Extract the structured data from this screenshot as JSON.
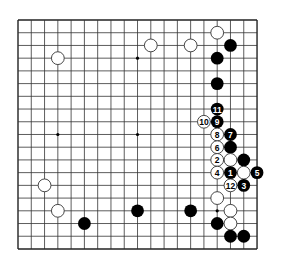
{
  "board": {
    "size": 19,
    "origin_x": 18,
    "origin_y": 20,
    "cell_w": 13.28,
    "cell_h": 12.72,
    "stone_radius": 6.4,
    "line_color": "#333333",
    "edge_color": "#222222",
    "black_color": "#000000",
    "white_fill": "#ffffff",
    "white_stroke": "#333333",
    "star_points": [
      [
        3,
        3
      ],
      [
        9,
        3
      ],
      [
        15,
        3
      ],
      [
        3,
        9
      ],
      [
        9,
        9
      ],
      [
        15,
        9
      ],
      [
        3,
        15
      ],
      [
        9,
        15
      ],
      [
        15,
        15
      ]
    ]
  },
  "stones": [
    {
      "color": "white",
      "col": 15,
      "row": 1,
      "label": ""
    },
    {
      "color": "white",
      "col": 3,
      "row": 3,
      "label": ""
    },
    {
      "color": "white",
      "col": 10,
      "row": 2,
      "label": ""
    },
    {
      "color": "white",
      "col": 13,
      "row": 2,
      "label": ""
    },
    {
      "color": "black",
      "col": 16,
      "row": 2,
      "label": ""
    },
    {
      "color": "black",
      "col": 15,
      "row": 3,
      "label": ""
    },
    {
      "color": "black",
      "col": 15,
      "row": 5,
      "label": ""
    },
    {
      "color": "black",
      "col": 15,
      "row": 7,
      "label": "11"
    },
    {
      "color": "white",
      "col": 14,
      "row": 8,
      "label": "10"
    },
    {
      "color": "black",
      "col": 15,
      "row": 8,
      "label": "9"
    },
    {
      "color": "white",
      "col": 15,
      "row": 9,
      "label": "8"
    },
    {
      "color": "black",
      "col": 16,
      "row": 9,
      "label": "7"
    },
    {
      "color": "white",
      "col": 15,
      "row": 10,
      "label": "6"
    },
    {
      "color": "black",
      "col": 16,
      "row": 10,
      "label": ""
    },
    {
      "color": "white",
      "col": 15,
      "row": 11,
      "label": "2"
    },
    {
      "color": "white",
      "col": 16,
      "row": 11,
      "label": ""
    },
    {
      "color": "black",
      "col": 17,
      "row": 11,
      "label": ""
    },
    {
      "color": "white",
      "col": 15,
      "row": 12,
      "label": "4"
    },
    {
      "color": "black",
      "col": 16,
      "row": 12,
      "label": "1"
    },
    {
      "color": "white",
      "col": 17,
      "row": 12,
      "label": ""
    },
    {
      "color": "black",
      "col": 18,
      "row": 12,
      "label": "5"
    },
    {
      "color": "white",
      "col": 16,
      "row": 13,
      "label": "12"
    },
    {
      "color": "black",
      "col": 17,
      "row": 13,
      "label": "3"
    },
    {
      "color": "white",
      "col": 2,
      "row": 13,
      "label": ""
    },
    {
      "color": "white",
      "col": 15,
      "row": 14,
      "label": ""
    },
    {
      "color": "white",
      "col": 3,
      "row": 15,
      "label": ""
    },
    {
      "color": "black",
      "col": 9,
      "row": 15,
      "label": ""
    },
    {
      "color": "black",
      "col": 13,
      "row": 15,
      "label": ""
    },
    {
      "color": "white",
      "col": 16,
      "row": 15,
      "label": ""
    },
    {
      "color": "black",
      "col": 5,
      "row": 16,
      "label": ""
    },
    {
      "color": "black",
      "col": 15,
      "row": 16,
      "label": ""
    },
    {
      "color": "white",
      "col": 16,
      "row": 16,
      "label": ""
    },
    {
      "color": "black",
      "col": 16,
      "row": 17,
      "label": ""
    },
    {
      "color": "black",
      "col": 17,
      "row": 17,
      "label": ""
    }
  ]
}
